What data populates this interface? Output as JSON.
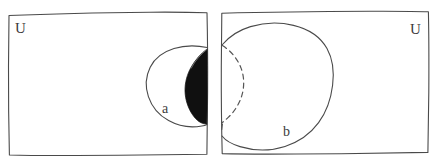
{
  "figure": {
    "style": "hand-drawn pencil sketch",
    "background_color": "#ffffff",
    "ink_color": "#4a4a4a",
    "shade_color": "#101010"
  },
  "panels": [
    {
      "id": "left-panel",
      "universe_label": "U",
      "universe_label_position": "top-left",
      "set_label": "a",
      "set_label_position": "lower-right-inside-circle",
      "shaded_region": "lens at right edge of circle a",
      "shaded": true,
      "dashed_arc": false
    },
    {
      "id": "right-panel",
      "universe_label": "U",
      "universe_label_position": "top-right",
      "set_label": "b",
      "set_label_position": "lower-left-inside-circle",
      "shaded_region": "",
      "shaded": false,
      "dashed_arc": true
    }
  ],
  "labels": {
    "universe_left": "U",
    "universe_right": "U",
    "set_a": "a",
    "set_b": "b"
  }
}
